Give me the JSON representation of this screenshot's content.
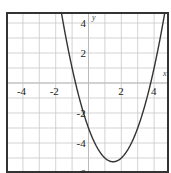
{
  "chart_data": {
    "type": "line",
    "title": "",
    "xlabel": "x",
    "ylabel": "y",
    "xlim": [
      -5,
      4.9
    ],
    "ylim": [
      -6,
      4.7
    ],
    "grid": true,
    "x_ticks": [
      -4,
      -2,
      2,
      4
    ],
    "y_ticks": [
      4,
      2,
      -2,
      -4,
      -6
    ],
    "x_tick_labels": [
      "-4",
      "-2",
      "2",
      "4"
    ],
    "y_tick_labels": [
      "4",
      "2",
      "-2",
      "-4",
      "-6"
    ],
    "series": [
      {
        "name": "parabola",
        "equation": "y = x^2 - 3x - 3",
        "x": [
          -1.6,
          -1,
          -0.5,
          0,
          0.5,
          1,
          1.5,
          2,
          2.5,
          3,
          3.5,
          4,
          4.6
        ],
        "y": [
          4.36,
          1,
          -1.25,
          -3,
          -4.25,
          -5,
          -5.25,
          -5,
          -4.25,
          -3,
          -1.25,
          1,
          4.36
        ]
      }
    ],
    "vertex": [
      1.5,
      -5.25
    ]
  },
  "labels": {
    "x_axis": "x",
    "y_axis": "y",
    "xt": [
      "-4",
      "-2",
      "2",
      "4"
    ],
    "yt": [
      "4",
      "2",
      "-2",
      "-4",
      "-6"
    ]
  }
}
